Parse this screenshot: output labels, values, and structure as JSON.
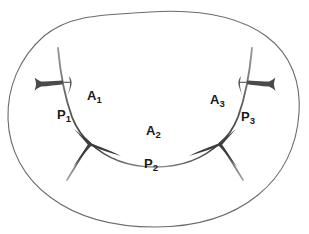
{
  "figure": {
    "background_color": "#ffffff",
    "outline_color": "#5a5a5a",
    "curve_color": "#4a4a4a",
    "label_color": "#1a1a1a",
    "width": 309,
    "height": 234
  },
  "labels": {
    "a1": {
      "base": "A",
      "sub": "1"
    },
    "p1": {
      "base": "P",
      "sub": "1"
    },
    "a2": {
      "base": "A",
      "sub": "2"
    },
    "p2": {
      "base": "P",
      "sub": "2"
    },
    "a3": {
      "base": "A",
      "sub": "3"
    },
    "p3": {
      "base": "P",
      "sub": "3"
    }
  },
  "geometry": {
    "outer_boundary": "M 150 12 C 196 9 238 16 266 36 C 292 55 301 84 299 113 C 297 146 283 175 258 195 C 231 217 194 227 155 227 C 116 227 78 218 50 197 C 24 178 9 150 8 119 C 7 88 19 58 44 36 C 72 13 110 15 150 12 Z",
    "arc_left": "M 58 48 C 60 70 64 95 72 117 C 78 132 85 139 90 143",
    "arc_right": "M 252 48 C 250 70 246 95 238 117 C 232 132 225 139 220 143",
    "arc_center": "M 90 143 C 108 160 132 167 155 167 C 178 167 202 160 220 143",
    "leg_left": "M 90 143 C 83 154 75 167 67 180",
    "leg_right": "M 220 143 C 227 154 235 167 243 180",
    "spur_left": "M 63 82 C 55 83 46 84 36 84",
    "spur_right": "M 247 82 C 255 83 264 84 274 84",
    "junction_left": {
      "x": 90,
      "y": 143
    },
    "junction_right": {
      "x": 220,
      "y": 143
    },
    "cusp_left": {
      "x": 36,
      "y": 84
    },
    "cusp_right": {
      "x": 274,
      "y": 84
    }
  }
}
